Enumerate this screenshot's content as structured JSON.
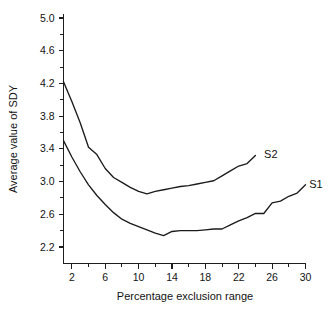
{
  "chart_data": {
    "type": "line",
    "title": "",
    "xlabel": "Percentage exclusion range",
    "ylabel": "Average value of SDY",
    "xlim": [
      1,
      30
    ],
    "ylim": [
      2.05,
      5.05
    ],
    "grid": false,
    "legend_position": "inline-right-end-labels",
    "x_ticks_major": [
      2,
      6,
      10,
      14,
      18,
      22,
      26,
      30
    ],
    "x_ticks_minor": [
      4,
      8,
      12,
      16,
      20,
      24,
      28
    ],
    "x_tick_labels": [
      "2",
      "6",
      "10",
      "14",
      "18",
      "22",
      "26",
      "30"
    ],
    "y_ticks_major": [
      2.2,
      2.6,
      3.0,
      3.4,
      3.8,
      4.2,
      4.6,
      5.0
    ],
    "y_ticks_minor": [
      2.4,
      2.8,
      3.2,
      3.6,
      4.0,
      4.4,
      4.8
    ],
    "y_tick_labels": [
      "2.2",
      "2.6",
      "3.0",
      "3.4",
      "3.8",
      "4.2",
      "4.6",
      "5.0"
    ],
    "series": [
      {
        "name": "S2",
        "label": "S2",
        "label_x": 24.8,
        "label_y": 3.33,
        "x": [
          1,
          2,
          3,
          4,
          5,
          6,
          7,
          8,
          9,
          10,
          11,
          12,
          13,
          14,
          15,
          16,
          17,
          18,
          19,
          20,
          21,
          22,
          23,
          24
        ],
        "y": [
          4.22,
          3.98,
          3.72,
          3.42,
          3.33,
          3.16,
          3.05,
          2.99,
          2.93,
          2.88,
          2.85,
          2.88,
          2.9,
          2.92,
          2.94,
          2.95,
          2.97,
          2.99,
          3.01,
          3.07,
          3.13,
          3.19,
          3.22,
          3.32
        ]
      },
      {
        "name": "S1",
        "label": "S1",
        "label_x": 30.2,
        "label_y": 2.97,
        "x": [
          1,
          2,
          3,
          4,
          5,
          6,
          7,
          8,
          9,
          10,
          11,
          12,
          13,
          14,
          15,
          16,
          17,
          18,
          19,
          20,
          21,
          22,
          23,
          24,
          25,
          26,
          27,
          28,
          29,
          30
        ],
        "y": [
          3.5,
          3.3,
          3.12,
          2.96,
          2.83,
          2.72,
          2.62,
          2.54,
          2.49,
          2.45,
          2.41,
          2.37,
          2.34,
          2.39,
          2.4,
          2.4,
          2.4,
          2.41,
          2.42,
          2.42,
          2.47,
          2.52,
          2.56,
          2.61,
          2.61,
          2.74,
          2.76,
          2.82,
          2.86,
          2.96
        ]
      }
    ]
  },
  "figure": {
    "background_color": "#ffffff",
    "line_color": "#1b1b1b",
    "text_color": "#131313"
  }
}
